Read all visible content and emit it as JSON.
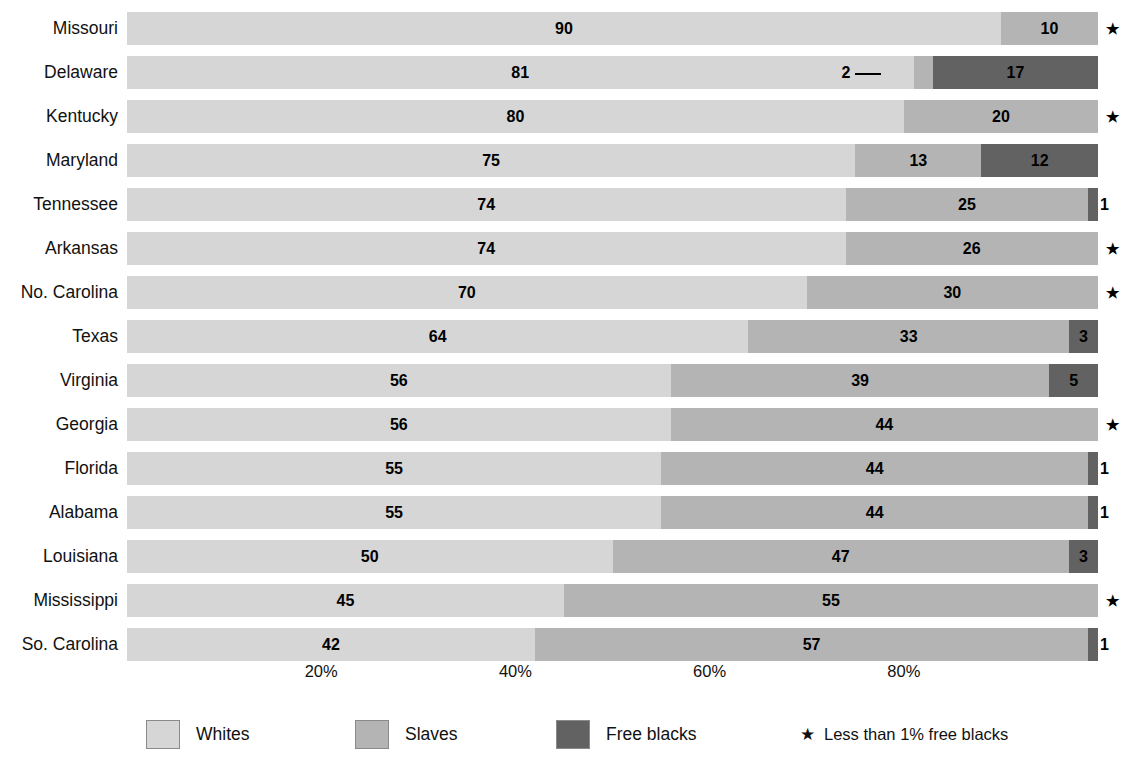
{
  "chart_data": {
    "type": "bar",
    "subtype": "stacked-horizontal-100-percent",
    "title": "",
    "xlabel": "",
    "ylabel": "",
    "xlim": [
      0,
      100
    ],
    "xticks": [
      20,
      40,
      60,
      80
    ],
    "xticklabels": [
      "20%",
      "40%",
      "60%",
      "80%"
    ],
    "grid": false,
    "legend_position": "bottom",
    "categories": [
      "Missouri",
      "Delaware",
      "Kentucky",
      "Maryland",
      "Tennessee",
      "Arkansas",
      "No. Carolina",
      "Texas",
      "Virginia",
      "Georgia",
      "Florida",
      "Alabama",
      "Louisiana",
      "Mississippi",
      "So. Carolina"
    ],
    "series": [
      {
        "name": "Whites",
        "color": "#d6d6d6",
        "values": [
          90,
          81,
          80,
          75,
          74,
          74,
          70,
          64,
          56,
          56,
          55,
          55,
          50,
          45,
          42
        ]
      },
      {
        "name": "Slaves",
        "color": "#b4b4b4",
        "values": [
          10,
          2,
          20,
          13,
          25,
          26,
          30,
          33,
          39,
          44,
          44,
          44,
          47,
          55,
          57
        ]
      },
      {
        "name": "Free blacks",
        "color": "#626262",
        "values": [
          0,
          17,
          0,
          12,
          1,
          0,
          0,
          3,
          5,
          0,
          1,
          1,
          3,
          0,
          1
        ]
      }
    ],
    "rows": [
      {
        "state": "Missouri",
        "whites": 90,
        "slaves": 10,
        "free_blacks": null,
        "star": true,
        "labels": {
          "whites": "90",
          "slaves": "10",
          "free_blacks": ""
        }
      },
      {
        "state": "Delaware",
        "whites": 81,
        "slaves": 2,
        "free_blacks": 17,
        "star": false,
        "labels": {
          "whites": "81",
          "slaves": "2",
          "free_blacks": "17"
        },
        "slaves_callout": true
      },
      {
        "state": "Kentucky",
        "whites": 80,
        "slaves": 20,
        "free_blacks": null,
        "star": true,
        "labels": {
          "whites": "80",
          "slaves": "20",
          "free_blacks": ""
        }
      },
      {
        "state": "Maryland",
        "whites": 75,
        "slaves": 13,
        "free_blacks": 12,
        "star": false,
        "labels": {
          "whites": "75",
          "slaves": "13",
          "free_blacks": "12"
        }
      },
      {
        "state": "Tennessee",
        "whites": 74,
        "slaves": 25,
        "free_blacks": 1,
        "star": false,
        "labels": {
          "whites": "74",
          "slaves": "25",
          "free_blacks": "1"
        },
        "free_blacks_outside": true
      },
      {
        "state": "Arkansas",
        "whites": 74,
        "slaves": 26,
        "free_blacks": null,
        "star": true,
        "labels": {
          "whites": "74",
          "slaves": "26",
          "free_blacks": ""
        }
      },
      {
        "state": "No. Carolina",
        "whites": 70,
        "slaves": 30,
        "free_blacks": null,
        "star": true,
        "labels": {
          "whites": "70",
          "slaves": "30",
          "free_blacks": ""
        }
      },
      {
        "state": "Texas",
        "whites": 64,
        "slaves": 33,
        "free_blacks": 3,
        "star": false,
        "labels": {
          "whites": "64",
          "slaves": "33",
          "free_blacks": "3"
        }
      },
      {
        "state": "Virginia",
        "whites": 56,
        "slaves": 39,
        "free_blacks": 5,
        "star": false,
        "labels": {
          "whites": "56",
          "slaves": "39",
          "free_blacks": "5"
        }
      },
      {
        "state": "Georgia",
        "whites": 56,
        "slaves": 44,
        "free_blacks": null,
        "star": true,
        "labels": {
          "whites": "56",
          "slaves": "44",
          "free_blacks": ""
        }
      },
      {
        "state": "Florida",
        "whites": 55,
        "slaves": 44,
        "free_blacks": 1,
        "star": false,
        "labels": {
          "whites": "55",
          "slaves": "44",
          "free_blacks": "1"
        },
        "free_blacks_outside": true
      },
      {
        "state": "Alabama",
        "whites": 55,
        "slaves": 44,
        "free_blacks": 1,
        "star": false,
        "labels": {
          "whites": "55",
          "slaves": "44",
          "free_blacks": "1"
        },
        "free_blacks_outside": true
      },
      {
        "state": "Louisiana",
        "whites": 50,
        "slaves": 47,
        "free_blacks": 3,
        "star": false,
        "labels": {
          "whites": "50",
          "slaves": "47",
          "free_blacks": "3"
        }
      },
      {
        "state": "Mississippi",
        "whites": 45,
        "slaves": 55,
        "free_blacks": null,
        "star": true,
        "labels": {
          "whites": "45",
          "slaves": "55",
          "free_blacks": ""
        }
      },
      {
        "state": "So. Carolina",
        "whites": 42,
        "slaves": 57,
        "free_blacks": 1,
        "star": false,
        "labels": {
          "whites": "42",
          "slaves": "57",
          "free_blacks": "1"
        },
        "free_blacks_outside": true
      }
    ]
  },
  "legend": {
    "items": [
      {
        "label": "Whites",
        "color": "#d6d6d6"
      },
      {
        "label": "Slaves",
        "color": "#b4b4b4"
      },
      {
        "label": "Free blacks",
        "color": "#626262"
      }
    ],
    "note_star": "★",
    "note_text": "Less than 1% free blacks"
  },
  "axis": {
    "ticks": [
      "20%",
      "40%",
      "60%",
      "80%"
    ]
  },
  "colors": {
    "whites": "#d6d6d6",
    "slaves": "#b4b4b4",
    "free_blacks": "#626262",
    "background": "#ffffff",
    "text": "#000000"
  }
}
